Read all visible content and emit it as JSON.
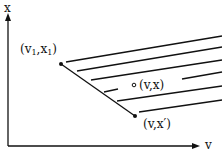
{
  "diagram": {
    "axes": {
      "y_label": "x",
      "x_label": "v"
    },
    "points": [
      {
        "id": "p1",
        "label_v": "(v",
        "sub1": "1",
        "mid": ",x",
        "sub2": "1",
        "close": ")"
      },
      {
        "id": "p2",
        "label": "(v,x)"
      },
      {
        "id": "p3",
        "label": "(v,x′)"
      }
    ],
    "stroke_color": "#111111",
    "background": "#ffffff"
  }
}
